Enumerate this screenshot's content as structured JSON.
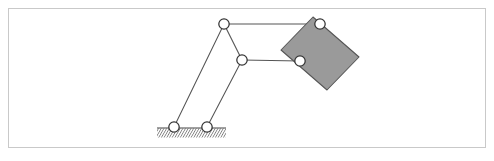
{
  "figure": {
    "canvas": {
      "width": 494,
      "height": 161
    },
    "frame": {
      "x": 8,
      "y": 8,
      "width": 478,
      "height": 140,
      "stroke": "#c9c9c9"
    },
    "colors": {
      "background": "#ffffff",
      "frame_border": "#c9c9c9",
      "link_stroke": "#555555",
      "joint_stroke": "#333333",
      "joint_fill": "#ffffff",
      "block_fill": "#9a9a9a",
      "block_stroke": "#555555",
      "ground_line": "#444444",
      "ground_hatch": "#6a6a6a"
    },
    "joints": [
      {
        "id": "ground-pivot-left",
        "label": "A0",
        "cx": 174,
        "cy": 127,
        "r": 5.2,
        "type": "fixed-pivot"
      },
      {
        "id": "ground-pivot-right",
        "label": "B0",
        "cx": 207,
        "cy": 127,
        "r": 5.2,
        "type": "fixed-pivot"
      },
      {
        "id": "joint-top-left",
        "label": "A",
        "cx": 224,
        "cy": 24,
        "r": 5.2,
        "type": "revolute"
      },
      {
        "id": "joint-middle",
        "label": "B",
        "cx": 242,
        "cy": 60,
        "r": 5.2,
        "type": "revolute"
      },
      {
        "id": "joint-top-right",
        "label": "C",
        "cx": 320,
        "cy": 24,
        "r": 5.2,
        "type": "revolute"
      },
      {
        "id": "joint-lower-right",
        "label": "D",
        "cx": 300,
        "cy": 61,
        "r": 5.2,
        "type": "revolute"
      }
    ],
    "links": [
      {
        "id": "link-crank-left",
        "from": "ground-pivot-left",
        "to": "joint-top-left"
      },
      {
        "id": "link-crank-right",
        "from": "ground-pivot-right",
        "to": "joint-middle"
      },
      {
        "id": "link-coupler-ab",
        "from": "joint-top-left",
        "to": "joint-middle"
      },
      {
        "id": "link-upper-bar",
        "from": "joint-top-left",
        "to": "joint-top-right"
      },
      {
        "id": "link-lower-bar",
        "from": "joint-middle",
        "to": "joint-lower-right"
      }
    ],
    "block": {
      "id": "coupler-block",
      "points": "313,17 359,57 327,90 281,50",
      "fill": "#9a9a9a",
      "stroke": "#555555"
    },
    "ground": {
      "id": "ground-support",
      "x1": 157,
      "x2": 226,
      "y": 128,
      "hatch_depth": 9,
      "hatch_count": 26,
      "hatch_slant": 6
    }
  }
}
